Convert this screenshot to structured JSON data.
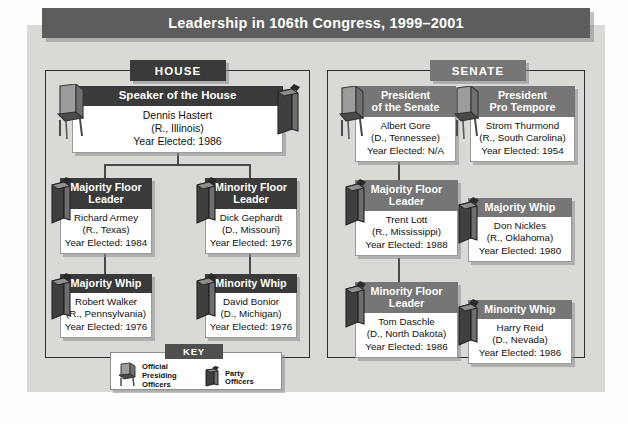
{
  "title": "Leadership in 106th Congress, 1999–2001",
  "chambers": [
    {
      "id": "house",
      "label": "HOUSE"
    },
    {
      "id": "senate",
      "label": "SENATE"
    }
  ],
  "house": {
    "speaker": {
      "role": "Speaker of the House",
      "name": "Dennis Hastert",
      "party_state": "(R., Illinois)",
      "year": "Year Elected: 1986",
      "icons": [
        "chair-icon",
        "podium-icon"
      ]
    },
    "majority_leader": {
      "role_line1": "Majority Floor",
      "role_line2": "Leader",
      "name": "Richard Armey",
      "party_state": "(R., Texas)",
      "year": "Year Elected: 1984",
      "icons": [
        "podium-icon"
      ]
    },
    "minority_leader": {
      "role_line1": "Minority Floor",
      "role_line2": "Leader",
      "name": "Dick Gephardt",
      "party_state": "(D., Missouri)",
      "year": "Year Elected: 1976",
      "icons": [
        "podium-icon"
      ]
    },
    "majority_whip": {
      "role": "Majority Whip",
      "name": "Robert Walker",
      "party_state": "(R., Pennsylvania)",
      "year": "Year Elected: 1976",
      "icons": [
        "podium-icon"
      ]
    },
    "minority_whip": {
      "role": "Minority Whip",
      "name": "David Bonior",
      "party_state": "(D., Michigan)",
      "year": "Year Elected: 1976",
      "icons": [
        "podium-icon"
      ]
    }
  },
  "senate": {
    "president": {
      "role_line1": "President",
      "role_line2": "of the Senate",
      "name": "Albert Gore",
      "party_state": "(D., Tennessee)",
      "year": "Year Elected: N/A",
      "icons": [
        "chair-icon"
      ]
    },
    "pro_tempore": {
      "role_line1": "President",
      "role_line2": "Pro Tempore",
      "name": "Strom Thurmond",
      "party_state": "(R., South Carolina)",
      "year": "Year Elected: 1954",
      "icons": [
        "chair-icon"
      ]
    },
    "majority_leader": {
      "role_line1": "Majority Floor",
      "role_line2": "Leader",
      "name": "Trent Lott",
      "party_state": "(R., Mississippi)",
      "year": "Year Elected: 1988",
      "icons": [
        "podium-icon"
      ]
    },
    "majority_whip": {
      "role": "Majority Whip",
      "name": "Don Nickles",
      "party_state": "(R., Oklahoma)",
      "year": "Year Elected: 1980",
      "icons": [
        "podium-icon"
      ]
    },
    "minority_leader": {
      "role_line1": "Minority Floor",
      "role_line2": "Leader",
      "name": "Tom Daschle",
      "party_state": "(D., North Dakota)",
      "year": "Year Elected: 1986",
      "icons": [
        "podium-icon"
      ]
    },
    "minority_whip": {
      "role": "Minority Whip",
      "name": "Harry Reid",
      "party_state": "(D., Nevada)",
      "year": "Year Elected: 1986",
      "icons": [
        "podium-icon"
      ]
    }
  },
  "key": {
    "label": "KEY",
    "entries": [
      {
        "icon": "chair-icon",
        "line1": "Official",
        "line2": "Presiding",
        "line3": "Officers"
      },
      {
        "icon": "podium-icon",
        "line1": "Party",
        "line2": "Officers",
        "line3": ""
      }
    ]
  },
  "colors": {
    "title_bar": "#5d5d5d",
    "house_header": "#3a3a3a",
    "senate_header": "#767676",
    "panel": "#d9d9d6",
    "card_body": "#ffffff",
    "connector": "#4a4a4a"
  }
}
